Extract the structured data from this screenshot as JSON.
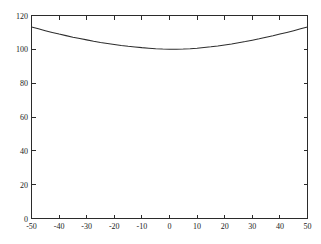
{
  "figure": {
    "background_color": "#fefefe",
    "plot_area_color": "#ffffff",
    "axis_color": "#2b2b2b",
    "curve_color": "#2e2e2e"
  },
  "chart_data": {
    "type": "line",
    "title": "",
    "subtitle": "",
    "xlabel": "",
    "ylabel": "",
    "xlim": [
      -50,
      50
    ],
    "ylim": [
      0,
      120
    ],
    "xticks": [
      -50,
      -40,
      -30,
      -20,
      -10,
      0,
      10,
      20,
      30,
      40,
      50
    ],
    "yticks": [
      0,
      20,
      40,
      60,
      80,
      100,
      120
    ],
    "xtick_labels": [
      "-50",
      "-40",
      "-30",
      "-20",
      "-10",
      "0",
      "10",
      "20",
      "30",
      "40",
      "50"
    ],
    "ytick_labels": [
      "0",
      "20",
      "40",
      "60",
      "80",
      "100",
      "120"
    ],
    "grid": false,
    "legend": null,
    "legend_position": "none",
    "annotations": [],
    "tick_direction": "in",
    "box": true,
    "series": [
      {
        "name": "curve",
        "x": [
          -50,
          -47.5,
          -45,
          -42.5,
          -40,
          -37.5,
          -35,
          -32.5,
          -30,
          -27.5,
          -25,
          -22.5,
          -20,
          -17.5,
          -15,
          -12.5,
          -10,
          -7.5,
          -5,
          -2.5,
          0,
          2.5,
          5,
          7.5,
          10,
          12.5,
          15,
          17.5,
          20,
          22.5,
          25,
          27.5,
          30,
          32.5,
          35,
          37.5,
          40,
          42.5,
          45,
          47.5,
          50
        ],
        "y": [
          113.2,
          112.1,
          111.0,
          110.0,
          109.0,
          108.1,
          107.2,
          106.4,
          105.6,
          104.8,
          104.1,
          103.5,
          102.9,
          102.3,
          101.8,
          101.4,
          101.0,
          100.7,
          100.4,
          100.2,
          100.1,
          100.1,
          100.2,
          100.4,
          100.7,
          101.1,
          101.5,
          102.0,
          102.6,
          103.2,
          103.9,
          104.6,
          105.4,
          106.2,
          107.1,
          108.0,
          109.0,
          110.0,
          111.0,
          112.1,
          113.2
        ]
      }
    ]
  }
}
